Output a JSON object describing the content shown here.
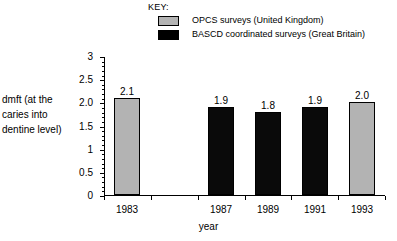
{
  "legend": {
    "title": "KEY:",
    "entries": [
      {
        "label": "OPCS surveys (United Kingdom)",
        "series": "opcs",
        "color": "#b3b3b3"
      },
      {
        "label": "BASCD coordinated surveys (Great Britain)",
        "series": "bascd",
        "color": "#000000"
      }
    ]
  },
  "axes": {
    "ylabel_lines": [
      "dmft (at the",
      "caries into",
      "dentine level)"
    ],
    "ylabel": "dmft (at the caries into dentine level)",
    "xlabel": "year"
  },
  "chart_data": {
    "type": "bar",
    "title": "",
    "xlabel": "year",
    "ylabel": "dmft (at the caries into dentine level)",
    "ylim": [
      0,
      3
    ],
    "ytick_values": [
      0,
      0.5,
      1,
      1.5,
      2,
      2.5,
      3
    ],
    "ytick_labels": [
      "0",
      "0.5",
      "1",
      "1.5",
      "2.0",
      "2.5",
      "3"
    ],
    "y_minor_tick_step": 0.1,
    "grid": false,
    "legend_position": "top-right",
    "categories": [
      "1983",
      "1985",
      "1987",
      "1989",
      "1991",
      "1993"
    ],
    "tick_labels_shown": [
      "1983",
      "",
      "1987",
      "1989",
      "1991",
      "1993"
    ],
    "values": [
      2.1,
      null,
      1.9,
      1.8,
      1.9,
      2.0
    ],
    "value_labels": [
      "2.1",
      "",
      "1.9",
      "1.8",
      "1.9",
      "2.0"
    ],
    "bar_series": [
      "opcs",
      null,
      "bascd",
      "bascd",
      "bascd",
      "opcs"
    ],
    "series": [
      {
        "name": "OPCS surveys (United Kingdom)",
        "key": "opcs",
        "color": "#b3b3b3",
        "points": [
          {
            "x": "1983",
            "y": 2.1
          },
          {
            "x": "1993",
            "y": 2.0
          }
        ]
      },
      {
        "name": "BASCD coordinated surveys (Great Britain)",
        "key": "bascd",
        "color": "#000000",
        "points": [
          {
            "x": "1987",
            "y": 1.9
          },
          {
            "x": "1989",
            "y": 1.8
          },
          {
            "x": "1991",
            "y": 1.9
          }
        ]
      }
    ]
  }
}
